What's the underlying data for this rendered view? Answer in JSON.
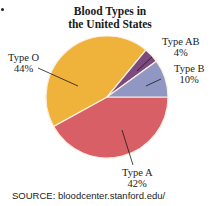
{
  "chart_data": {
    "type": "pie",
    "title": "Blood Types in the United States",
    "title_lines": [
      "Blood Types in",
      "the United States"
    ],
    "categories": [
      "Type A",
      "Type O",
      "Type AB",
      "Type B"
    ],
    "values": [
      42,
      44,
      4,
      10
    ],
    "unit": "%",
    "colors": {
      "Type A": "#d95f66",
      "Type O": "#efb23a",
      "Type AB": "#7b4a7e",
      "Type B": "#8f97c2"
    },
    "labels": [
      {
        "name": "Type O",
        "value": "44%"
      },
      {
        "name": "Type AB",
        "value": "4%"
      },
      {
        "name": "Type B",
        "value": "10%"
      },
      {
        "name": "Type A",
        "value": "42%"
      }
    ],
    "source": "SOURCE: bloodcenter.stanford.edu/"
  }
}
